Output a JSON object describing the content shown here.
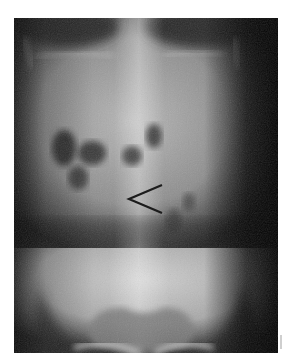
{
  "image": {
    "type": "abdominal radiograph",
    "view": "frontal (AP)",
    "annotation": {
      "shape": "arrowhead",
      "direction": "pointing-left",
      "color": "#1c1c1c"
    },
    "colors": {
      "background": "#ffffff",
      "film_dark": "#141414",
      "soft_tissue": "#8a8a8a",
      "bone": "#d8d8d8"
    }
  }
}
